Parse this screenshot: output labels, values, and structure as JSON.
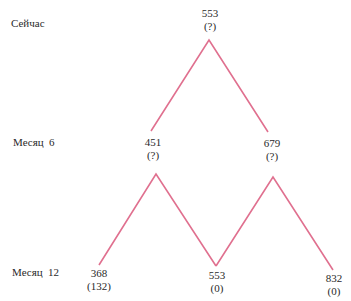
{
  "colors": {
    "line": "#e0708f",
    "text": "#2a2a2a"
  },
  "rows": [
    {
      "label": "Сейчас"
    },
    {
      "label": "Месяц  6"
    },
    {
      "label": "Месяц  12"
    }
  ],
  "nodes": {
    "now": {
      "value": "553",
      "sub": "(?)"
    },
    "m6_low": {
      "value": "451",
      "sub": "(?)"
    },
    "m6_high": {
      "value": "679",
      "sub": "(?)"
    },
    "m12_low": {
      "value": "368",
      "sub": "(132)"
    },
    "m12_mid": {
      "value": "553",
      "sub": "(0)"
    },
    "m12_high": {
      "value": "832",
      "sub": "(0)"
    }
  }
}
